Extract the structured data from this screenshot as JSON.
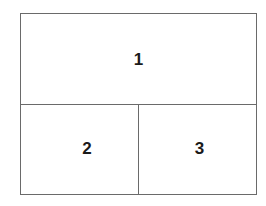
{
  "diagram": {
    "panels": [
      {
        "id": "top",
        "label": "1"
      },
      {
        "id": "bottom-left",
        "label": "2"
      },
      {
        "id": "bottom-right",
        "label": "3"
      }
    ],
    "border_color": "#6a6a6a",
    "text_color": "#1a1a1a"
  }
}
